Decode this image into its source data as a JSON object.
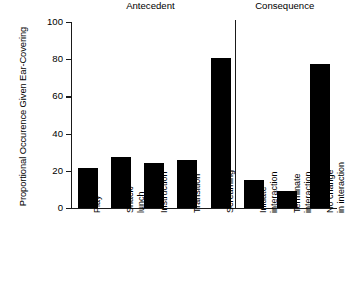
{
  "chart_data": {
    "type": "bar",
    "title": "",
    "xlabel": "",
    "ylabel": "Proportional Occurence Given Ear-Covering",
    "ylim": [
      0,
      100
    ],
    "yticks": [
      0,
      20,
      40,
      60,
      80,
      100
    ],
    "grid": false,
    "legend": null,
    "orientation": "vertical",
    "bar_color": "#000000",
    "categories": [
      "Play",
      "Snack/\nlunch",
      "Instruction",
      "Transition",
      "Screaming",
      "Initiate\ninteraction",
      "Terminate\ninteraction",
      "No change\nin interaction"
    ],
    "values": [
      21.5,
      27.5,
      24,
      26,
      80.5,
      15,
      9,
      77.5
    ],
    "groups": [
      {
        "label": "Antecedent",
        "categories": [
          "Play",
          "Snack/ lunch",
          "Instruction",
          "Transition",
          "Screaming"
        ]
      },
      {
        "label": "Consequence",
        "categories": [
          "Initiate interaction",
          "Terminate interaction",
          "No change in interaction"
        ]
      }
    ],
    "annotations": [
      {
        "type": "vertical-divider",
        "after_category": "Screaming"
      }
    ]
  },
  "axes": {
    "y_tick_labels": [
      "0",
      "20",
      "40",
      "60",
      "80",
      "100"
    ],
    "y_axis_title": "Proportional Occurence Given Ear-Covering"
  },
  "sections": {
    "antecedent_label": "Antecedent",
    "consequence_label": "Consequence"
  },
  "xlabels": [
    {
      "line1": "Play",
      "line2": ""
    },
    {
      "line1": "Snack/",
      "line2": "lunch"
    },
    {
      "line1": "Instruction",
      "line2": ""
    },
    {
      "line1": "Transition",
      "line2": ""
    },
    {
      "line1": "Screaming",
      "line2": ""
    },
    {
      "line1": "Initiate",
      "line2": "interaction"
    },
    {
      "line1": "Terminate",
      "line2": "interaction"
    },
    {
      "line1": "No change",
      "line2": "in interaction"
    }
  ]
}
